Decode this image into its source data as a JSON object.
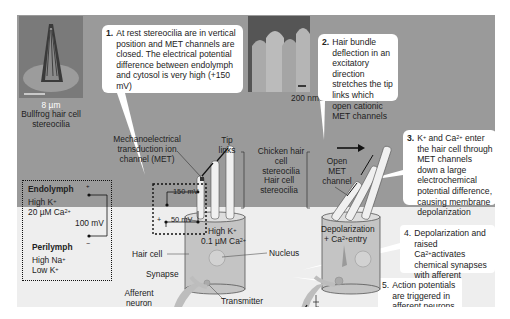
{
  "steps": [
    {
      "num": "1.",
      "text": "At rest stereocilia are in vertical position and MET channels are closed. The electrical potential difference between endolymph and cytosol is very high (+150 mV)"
    },
    {
      "num": "2.",
      "text": "Hair bundle deflection in an excitatory direction stretches the tip links which open cationic MET channels"
    },
    {
      "num": "3.",
      "text_html_parts": [
        "K",
        "+",
        " and Ca",
        "2+",
        " enter the hair cell through MET channels down a large electrochemical potential difference, causing membrane depolarization"
      ]
    },
    {
      "num": "4.",
      "text_parts": [
        "Depolarization and raised Ca",
        "2+",
        "activates chemical synapses with afferent neurons"
      ]
    },
    {
      "num": "5.",
      "text": "Action potentials are triggered in afferent neurons"
    }
  ],
  "micrographs": [
    {
      "scale": "8 µm",
      "caption": "Bullfrog hair cell stereocilia"
    },
    {
      "scale": "200 nm",
      "caption": "Chicken hair cell stereocilia"
    }
  ],
  "compartments": {
    "endolymph": {
      "title": "Endolymph",
      "line1": "High K",
      "line1_sup": "+",
      "line2": "20 µM Ca",
      "line2_sup": "2+"
    },
    "perilymph": {
      "title": "Perilymph",
      "line1": "High Na",
      "line1_sup": "+",
      "line2": "Low K",
      "line2_sup": "+"
    },
    "potential": "100 mV"
  },
  "resting_cell": {
    "met_label": "Mechanoelectrical transduction ion channel (MET)",
    "tip_links": "Tip links",
    "stereocilia_label": "Hair cell stereocilia",
    "v1": "150 mV",
    "v2": "50 mV",
    "plus": "+",
    "minus": "−",
    "cytosol_line1": "High K",
    "cytosol_line1_sup": "+",
    "cytosol_line2": "0.1 µM Ca",
    "cytosol_line2_sup": "2+",
    "hair_cell": "Hair cell",
    "nucleus": "Nucleus",
    "synapse": "Synapse",
    "afferent": "Afferent neuron",
    "release_site": "Transmitter release site"
  },
  "active_cell": {
    "open_met": "Open MET channel",
    "depol_line1": "Depolarization",
    "depol_line2_pre": "+ Ca",
    "depol_line2_sup": "2+",
    "depol_line2_post": "entry"
  },
  "colors": {
    "top_bg": "#9a9a9a",
    "bottom_bg": "#eeeeee",
    "box_bg": "#ffffff",
    "cell_fill": "#c8c8c8",
    "text": "#222222"
  }
}
